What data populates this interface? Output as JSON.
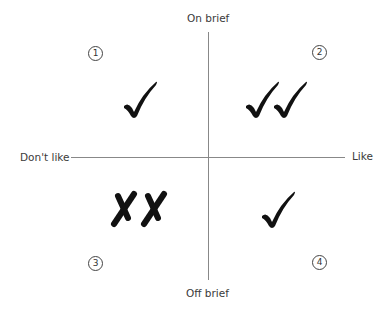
{
  "axes": {
    "top": "On brief",
    "bottom": "Off brief",
    "left": "Don't like",
    "right": "Like"
  },
  "quadrants": [
    {
      "number": "1",
      "position": "top-left",
      "marks": "check",
      "count": 1
    },
    {
      "number": "2",
      "position": "top-right",
      "marks": "check",
      "count": 2
    },
    {
      "number": "3",
      "position": "bottom-left",
      "marks": "cross",
      "count": 2
    },
    {
      "number": "4",
      "position": "bottom-right",
      "marks": "check",
      "count": 1
    }
  ],
  "colors": {
    "axis": "#888888",
    "mark": "#111111",
    "text": "#3a3a3a"
  }
}
